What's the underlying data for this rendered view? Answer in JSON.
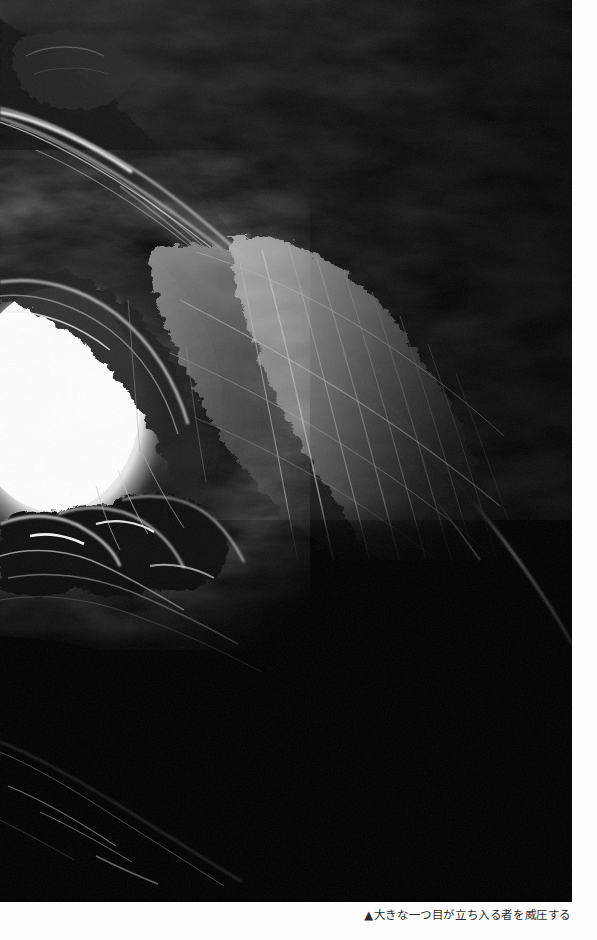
{
  "page": {
    "background_color": "#fdfdfd",
    "width": 597,
    "height": 940
  },
  "photo": {
    "name": "cave-interior-photograph",
    "description": "Black and white photograph taken from inside a cave looking outward toward a brightly blown-out cave mouth on the left; dark textured rock walls and ceiling fill the rest of the frame",
    "palette": {
      "shadow": "#000000",
      "rock_dark": "#0b0b0b",
      "rock_mid": "#4a4a4a",
      "rock_light": "#9c9c9c",
      "highlight": "#ffffff",
      "opening_glow": "#ffffff"
    },
    "frame": {
      "left": 0,
      "top": 0,
      "width": 572,
      "height": 902
    },
    "opening": {
      "center_x": 62,
      "center_y": 412,
      "radius_x": 105,
      "radius_y": 135
    }
  },
  "caption": {
    "marker": "▲",
    "text": "▲大きな一つ目が立ち入る者を威圧する",
    "align": "right",
    "color": "#2b2b2b"
  }
}
